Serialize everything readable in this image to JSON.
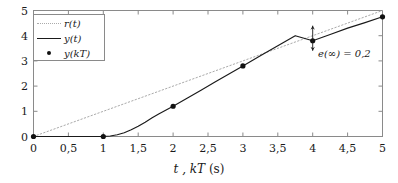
{
  "chart_data": {
    "type": "line",
    "title": "",
    "xlabel": "t , kT (s)",
    "ylabel": "",
    "xlim": [
      0,
      5
    ],
    "ylim": [
      0,
      5
    ],
    "grid": false,
    "legend_position": "top-left",
    "xticks": [
      0,
      0.5,
      1,
      1.5,
      2,
      2.5,
      3,
      3.5,
      4,
      4.5,
      5
    ],
    "xtick_labels": [
      "0",
      "0,5",
      "1",
      "1,5",
      "2",
      "2,5",
      "3",
      "3,5",
      "4",
      "4,5",
      "5"
    ],
    "yticks": [
      0,
      1,
      2,
      3,
      4,
      5
    ],
    "ytick_labels": [
      "0",
      "1",
      "2",
      "3",
      "4",
      "5"
    ],
    "series": [
      {
        "name": "r(t)",
        "style": "dotted",
        "color": "#aaaaaa",
        "x": [
          0,
          5
        ],
        "values": [
          0,
          5
        ]
      },
      {
        "name": "y(t)",
        "style": "solid",
        "color": "#1a1a1a",
        "x": [
          0,
          0.2,
          0.4,
          0.6,
          0.8,
          1.0,
          1.1,
          1.2,
          1.3,
          1.4,
          1.5,
          1.6,
          1.7,
          1.8,
          1.9,
          2.0,
          2.2,
          2.4,
          2.6,
          2.8,
          3.0,
          3.25,
          3.5,
          3.75,
          4.0,
          4.25,
          4.5,
          4.75,
          5.0
        ],
        "values": [
          0,
          0,
          0,
          0,
          0,
          0,
          0.02,
          0.07,
          0.15,
          0.27,
          0.41,
          0.57,
          0.74,
          0.9,
          1.05,
          1.2,
          1.52,
          1.84,
          2.16,
          2.48,
          2.8,
          3.2,
          3.6,
          4.0,
          3.8,
          4.05,
          4.3,
          4.52,
          4.75
        ]
      },
      {
        "name": "y(kT)",
        "style": "markers",
        "color": "#111111",
        "x": [
          0,
          1,
          2,
          3,
          4,
          5
        ],
        "values": [
          0,
          0,
          1.2,
          2.8,
          3.8,
          4.75
        ]
      }
    ],
    "annotations": [
      {
        "name": "steady-state-error",
        "text": "e(∞) = 0,2",
        "x": 4,
        "y_from": 3.8,
        "y_to": 4.0,
        "arrow": "double-headed-vertical"
      }
    ]
  },
  "legend": {
    "entries": [
      {
        "label": "r(t)",
        "style": "dotted"
      },
      {
        "label": "y(t)",
        "style": "solid"
      },
      {
        "label": "y(kT)",
        "style": "marker"
      }
    ]
  },
  "axis": {
    "x_title_main": "t , kT",
    "x_title_unit": "(s)"
  },
  "annotation": {
    "text": "e(∞) = 0,2"
  },
  "colors": {
    "reference_line": "#aaaaaa",
    "response_line": "#1a1a1a",
    "marker": "#111111",
    "frame": "#8a8a8a",
    "background": "#ffffff"
  }
}
